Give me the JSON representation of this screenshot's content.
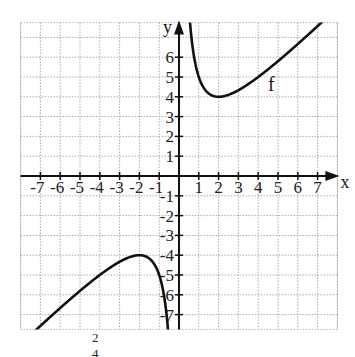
{
  "chart_data": {
    "type": "line",
    "title": "",
    "xlabel": "x",
    "ylabel": "y",
    "xlim": [
      -8,
      8
    ],
    "ylim": [
      -7.75,
      7.75
    ],
    "grid": true,
    "x_ticks": [
      -7,
      -6,
      -5,
      -4,
      -3,
      -2,
      -1,
      1,
      2,
      3,
      4,
      5,
      6,
      7
    ],
    "y_ticks": [
      -7,
      -6,
      -5,
      -4,
      -3,
      -2,
      -1,
      1,
      2,
      3,
      4,
      5,
      6
    ],
    "x_tick_labels": [
      "-7",
      "-6",
      "-5",
      "-4",
      "-3",
      "-2",
      "-1",
      "1",
      "2",
      "3",
      "4",
      "5",
      "6",
      "7"
    ],
    "y_tick_labels": [
      "-7",
      "-6",
      "-5",
      "-4",
      "-3",
      "-2",
      "-1",
      "1",
      "2",
      "3",
      "4",
      "5",
      "6"
    ],
    "series": [
      {
        "name": "f",
        "formula": "f(x) = x + 4/x",
        "color": "#111111",
        "branches": [
          {
            "x": [
              0.55,
              0.75,
              1,
              1.5,
              2,
              2.5,
              3,
              4,
              5,
              6,
              7.6
            ],
            "y": [
              7.82,
              6.08,
              5.0,
              4.17,
              4.0,
              4.1,
              4.33,
              5.0,
              5.8,
              6.67,
              8.13
            ]
          },
          {
            "x": [
              -7.6,
              -6,
              -5,
              -4,
              -3,
              -2.5,
              -2,
              -1.5,
              -1,
              -0.75,
              -0.55
            ],
            "y": [
              -8.13,
              -6.67,
              -5.8,
              -5.0,
              -4.33,
              -4.1,
              -4.0,
              -4.17,
              -5.0,
              -6.08,
              -7.82
            ]
          }
        ],
        "key_points": {
          "local_min": [
            2,
            4
          ],
          "local_max": [
            -2,
            -4
          ],
          "vertical_asymptote": "x = 0"
        }
      }
    ],
    "annotations": [
      {
        "text": "f",
        "x": 4.5,
        "y": 4.3
      }
    ]
  },
  "footer": {
    "partial_formula_text": "2   4"
  }
}
